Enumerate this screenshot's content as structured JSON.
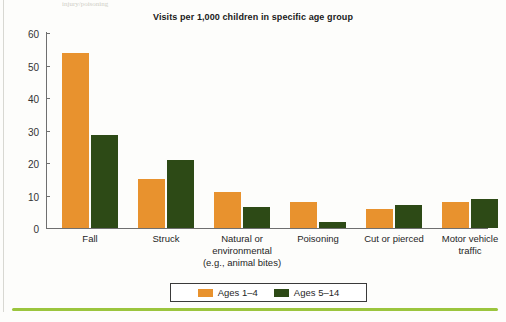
{
  "page": {
    "top_artifact_text": "injury/poisoning",
    "background_color": "#fdfdfb",
    "bottom_rule_color": "#9bc53d"
  },
  "chart_data": {
    "type": "bar",
    "title": "Visits per 1,000 children in specific age group",
    "xlabel": "",
    "ylabel": "",
    "ylim": [
      0,
      60
    ],
    "yticks": [
      0,
      10,
      20,
      30,
      40,
      50,
      60
    ],
    "ytick_labels": [
      "0",
      "10",
      "20",
      "30",
      "40",
      "50",
      "60"
    ],
    "grid": false,
    "legend_position": "bottom-center",
    "categories": [
      "Fall",
      "Struck",
      "Natural or\nenvironmental\n(e.g., animal bites)",
      "Poisoning",
      "Cut or pierced",
      "Motor vehicle\ntraffic"
    ],
    "category_lines": [
      [
        "Fall"
      ],
      [
        "Struck"
      ],
      [
        "Natural or",
        "environmental",
        "(e.g., animal bites)"
      ],
      [
        "Poisoning"
      ],
      [
        "Cut or pierced"
      ],
      [
        "Motor vehicle",
        "traffic"
      ]
    ],
    "series": [
      {
        "name": "Ages 1–4",
        "color": "#e8922e",
        "values": [
          54,
          15,
          11,
          8,
          6,
          8
        ]
      },
      {
        "name": "Ages 5–14",
        "color": "#2d4a16",
        "values": [
          28.5,
          21,
          6.5,
          2,
          7,
          9
        ]
      }
    ]
  }
}
